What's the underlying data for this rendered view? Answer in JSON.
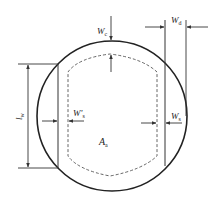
{
  "diagram": {
    "type": "cross-section",
    "colors": {
      "outline": "#222222",
      "dimension_line": "#333333",
      "dashed_area": "#555555",
      "background": "#ffffff"
    },
    "labels": {
      "wc": {
        "main": "W",
        "sub": "c"
      },
      "wd": {
        "main": "W",
        "sub": "d"
      },
      "lw": {
        "main": "l",
        "sub": "w"
      },
      "ws_prime": {
        "main": "W'",
        "sub": "s"
      },
      "ws": {
        "main": "W",
        "sub": "s"
      },
      "aa": {
        "main": "A",
        "sub": "a"
      }
    }
  }
}
